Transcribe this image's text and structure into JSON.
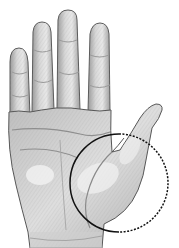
{
  "image": {
    "subject": "Pencil sketch of an open left palm with a circle highlighting the thumb base",
    "alt": "Hand palm illustration with circled thumb mount",
    "colors": {
      "background": "#ffffff",
      "outline": "#4a4a4a",
      "shade_dark": "#8a8a8a",
      "shade_mid": "#b8b8b8",
      "shade_light": "#dcdcdc",
      "highlight": "#f2f2f2",
      "circle": "#111111"
    },
    "highlight_circle": {
      "cx": 119,
      "cy": 183,
      "r": 49,
      "style_left": "solid",
      "style_right": "dashed"
    }
  }
}
